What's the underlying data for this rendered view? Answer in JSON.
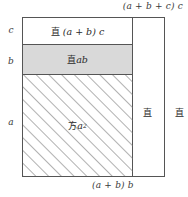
{
  "figure": {
    "colors": {
      "stroke": "#555555",
      "gray_fill": "#d9d9d9",
      "white_fill": "#ffffff",
      "hatch": "#6f6f6f",
      "text": "#2b2b2b"
    }
  },
  "captions": {
    "top_right": "(a + b + c) c",
    "bottom": "(a + b) b"
  },
  "side_labels": {
    "c": "c",
    "b": "b",
    "a": "a"
  },
  "regions": {
    "top_band": {
      "cjk": "直",
      "math": "(a + b) c",
      "fill": "white"
    },
    "mid_band": {
      "cjk": "直",
      "math": "ab",
      "fill": "gray"
    },
    "square": {
      "cjk": "方",
      "math": "a",
      "exponent": "2",
      "fill": "hatched"
    },
    "column_middle": {
      "cjk": "直",
      "fill": "gray"
    },
    "column_right": {
      "cjk": "直",
      "fill": "white"
    }
  }
}
